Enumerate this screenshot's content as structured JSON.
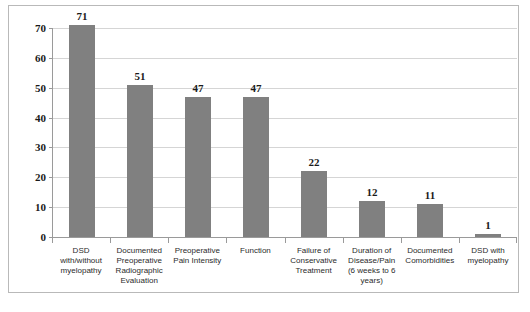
{
  "chart_data": {
    "type": "bar",
    "title": "",
    "xlabel": "",
    "ylabel": "",
    "ylim": [
      0,
      70
    ],
    "yticks": [
      0,
      10,
      20,
      30,
      40,
      50,
      60,
      70
    ],
    "grid": true,
    "legend": false,
    "bar_color": "#808080",
    "gridline_color": "#d5d5d5",
    "axis_color": "#9a9a9a",
    "categories": [
      "DSD with/without myelopathy",
      "Documented Preoperative Radiographic Evaluation",
      "Preoperative Pain Intensity",
      "Function",
      "Failure of Conservative Treatment",
      "Duration of Disease/Pain (6 weeks to 6 years)",
      "Documented Comorbidities",
      "DSD with myelopathy"
    ],
    "values": [
      71,
      51,
      47,
      47,
      22,
      12,
      11,
      1
    ],
    "data_labels": [
      "71",
      "51",
      "47",
      "47",
      "22",
      "12",
      "11",
      "1"
    ],
    "ytick_labels": [
      "0",
      "10",
      "20",
      "30",
      "40",
      "50",
      "60",
      "70"
    ]
  },
  "caption": ""
}
